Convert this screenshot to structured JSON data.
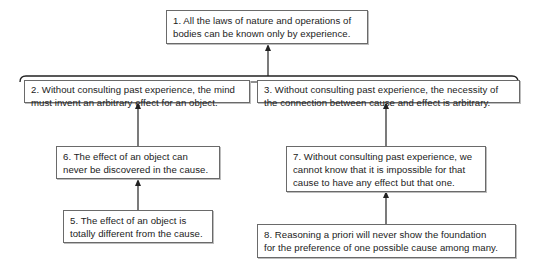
{
  "diagram": {
    "type": "argument-map",
    "conclusion": {
      "id": 1,
      "lines": [
        "1. All the laws of nature and operations of",
        "bodies can be known only by experience."
      ]
    },
    "premises": [
      {
        "id": 2,
        "lines": [
          "2. Without consulting past experience, the mind",
          "must invent an arbitrary effect for an object."
        ],
        "supports": 1,
        "joint_with": 3
      },
      {
        "id": 3,
        "lines": [
          "3. Without consulting past experience, the necessity of",
          "the connection between cause and effect is arbitrary."
        ],
        "supports": 1,
        "joint_with": 2
      },
      {
        "id": 6,
        "lines": [
          "6. The effect of an object can",
          "never be discovered in the cause."
        ],
        "supports": 2
      },
      {
        "id": 5,
        "lines": [
          "5. The effect of an object is",
          "totally different from the cause."
        ],
        "supports": 6
      },
      {
        "id": 7,
        "lines": [
          "7. Without consulting past experience, we",
          "cannot know that it is impossible for that",
          "cause to have any effect but that one."
        ],
        "supports": 3
      },
      {
        "id": 8,
        "lines": [
          "8. Reasoning a priori will never show the foundation",
          "for the preference of one possible cause among many."
        ],
        "supports": 7
      }
    ],
    "colors": {
      "line": "#222222",
      "border": "#6a6a6a",
      "background": "#ffffff"
    }
  }
}
